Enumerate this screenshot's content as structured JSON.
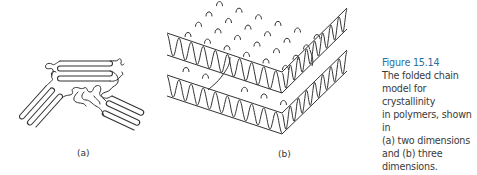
{
  "figure": {
    "number_label": "Figure 15.14",
    "caption_lines": [
      "The folded chain",
      "model for crystallinity",
      "in polymers, shown in",
      "(a) two dimensions",
      "and (b) three",
      "dimensions."
    ],
    "panels": [
      {
        "id": "a",
        "label": "(a)",
        "description": "two-dimensional folded chain lamellae"
      },
      {
        "id": "b",
        "label": "(b)",
        "description": "three-dimensional stacked folded chain layers"
      }
    ],
    "accent_color": "#2a6ea0"
  }
}
